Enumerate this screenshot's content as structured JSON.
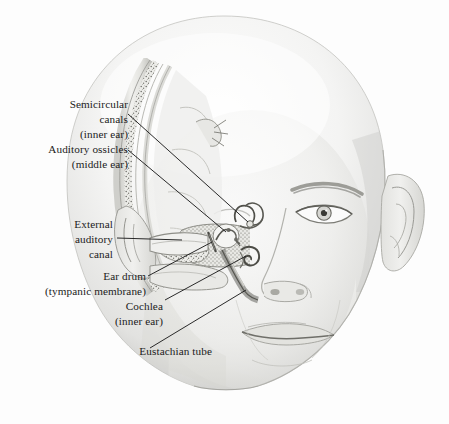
{
  "figure": {
    "background_color": "#fdfdfd",
    "ink_color": "#1b1b1b",
    "style": "grayscale pencil / stipple medical illustration"
  },
  "labels": [
    {
      "id": "semicircular-canals",
      "line1": "Semicircular",
      "line2": "canals",
      "line3": "(inner ear)"
    },
    {
      "id": "auditory-ossicles",
      "line1": "Auditory ossicles",
      "line2": "(middle ear)"
    },
    {
      "id": "external-auditory-canal",
      "line1": "External",
      "line2": "auditory",
      "line3": "canal"
    },
    {
      "id": "ear-drum",
      "line1": "Ear drum",
      "line2": "(tympanic membrane)"
    },
    {
      "id": "cochlea",
      "line1": "Cochlea",
      "line2": "(inner ear)"
    },
    {
      "id": "eustachian-tube",
      "line1": "Eustachian tube"
    }
  ]
}
